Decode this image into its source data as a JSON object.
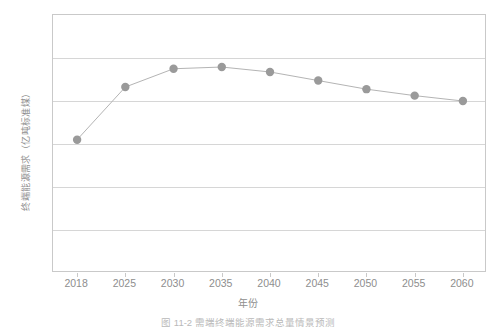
{
  "figure": {
    "caption": "图 11-2  需端终端能源需求总量情景预测",
    "xtitle": "年份",
    "ytitle": "终端能源需求（亿吨标准煤）"
  },
  "style": {
    "marker_color": "#9a9a9a",
    "line_color": "#b4b4b4",
    "grid_color": "#d6d6d6",
    "axis_color": "#c9c9c9",
    "text_color": "#8e8e8e"
  },
  "chart_data": {
    "type": "line",
    "title": "",
    "xlabel": "年份",
    "ylabel": "终端能源需求（亿吨标准煤）",
    "categories": [
      "2018",
      "2025",
      "2030",
      "2035",
      "2040",
      "2045",
      "2050",
      "2055",
      "2060"
    ],
    "x": [
      2018,
      2025,
      2030,
      2035,
      2040,
      2045,
      2050,
      2055,
      2060
    ],
    "values": [
      62,
      86.5,
      95,
      95.8,
      93.5,
      89.5,
      85.5,
      82.5,
      80
    ],
    "series": [
      {
        "name": "终端能源需求",
        "values": [
          62,
          86.5,
          95,
          95.8,
          93.5,
          89.5,
          85.5,
          82.5,
          80
        ]
      }
    ],
    "yticks": [
      0,
      20,
      40,
      60,
      80,
      100,
      120
    ],
    "ytick_labels": [
      "0",
      "20",
      "40",
      "60",
      "80",
      "100",
      "120"
    ],
    "ylim": [
      0,
      120
    ],
    "grid": "horizontal",
    "legend": "none",
    "markers": "circle"
  }
}
